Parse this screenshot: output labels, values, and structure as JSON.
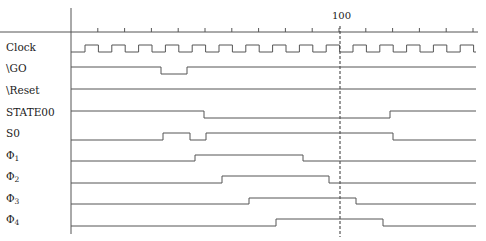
{
  "diagram": {
    "type": "timing-diagram",
    "marker_label": "100",
    "colors": {
      "wave": "#555555",
      "axis": "#555555",
      "dashed": "#333333",
      "text": "#222222"
    },
    "axis": {
      "x0": 71,
      "y": 32,
      "tick_spacing": 26.8,
      "tick_count": 15,
      "vertical_top": 8,
      "vertical_bottom": 234,
      "x_end": 478
    },
    "marker": {
      "x": 340,
      "y_top": 32,
      "y_bottom": 237
    },
    "signals": [
      {
        "name": "Clock",
        "sub": "",
        "label_y": 41,
        "high_y": 45,
        "low_y": 52,
        "kind": "clock",
        "first_rise": 85,
        "half_period": 13.4,
        "start_level": 0
      },
      {
        "name": "\\GO",
        "sub": "",
        "label_y": 62,
        "high_y": 67,
        "low_y": 74,
        "start_level": 1,
        "edges": [
          161,
          187
        ]
      },
      {
        "name": "\\Reset",
        "sub": "",
        "label_y": 84,
        "high_y": 89,
        "low_y": 96,
        "start_level": 1,
        "edges": []
      },
      {
        "name": "STATE00",
        "sub": "",
        "label_y": 106,
        "high_y": 111,
        "low_y": 118,
        "start_level": 1,
        "edges": [
          204,
          390
        ]
      },
      {
        "name": "S0",
        "sub": "",
        "label_y": 127,
        "high_y": 133,
        "low_y": 140,
        "start_level": 0,
        "edges": [
          163,
          190,
          206,
          393
        ]
      },
      {
        "name": "Φ",
        "sub": "1",
        "label_y": 149,
        "high_y": 155,
        "low_y": 161,
        "start_level": 0,
        "edges": [
          195,
          303
        ]
      },
      {
        "name": "Φ",
        "sub": "2",
        "label_y": 170,
        "high_y": 176,
        "low_y": 183,
        "start_level": 0,
        "edges": [
          222,
          329
        ]
      },
      {
        "name": "Φ",
        "sub": "3",
        "label_y": 192,
        "high_y": 198,
        "low_y": 204,
        "start_level": 0,
        "edges": [
          249,
          356
        ]
      },
      {
        "name": "Φ",
        "sub": "4",
        "label_y": 213,
        "high_y": 219,
        "low_y": 226,
        "start_level": 0,
        "edges": [
          276,
          383
        ]
      }
    ]
  }
}
